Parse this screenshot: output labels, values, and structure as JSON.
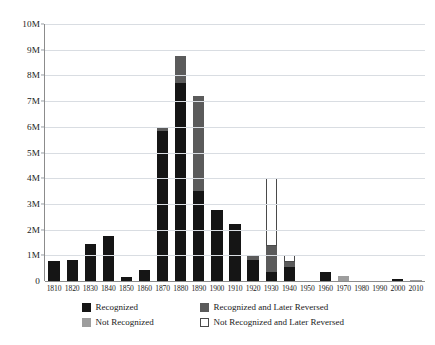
{
  "chart_data": {
    "type": "bar",
    "title": "",
    "subtitle": "",
    "xlabel": "",
    "ylabel": "",
    "stacked": true,
    "grid": true,
    "legend_position": "bottom",
    "ylim": [
      0,
      10000000
    ],
    "ytick_values": [
      0,
      1000000,
      2000000,
      3000000,
      4000000,
      5000000,
      6000000,
      7000000,
      8000000,
      9000000,
      10000000
    ],
    "ytick_labels": [
      "0",
      "1M",
      "2M",
      "3M",
      "4M",
      "5M",
      "6M",
      "7M",
      "8M",
      "9M",
      "10M"
    ],
    "categories": [
      "1810",
      "1820",
      "1830",
      "1840",
      "1850",
      "1860",
      "1870",
      "1880",
      "1890",
      "1900",
      "1910",
      "1920",
      "1930",
      "1940",
      "1950",
      "1960",
      "1970",
      "1980",
      "1990",
      "2000",
      "2010"
    ],
    "series": [
      {
        "name": "Recognized",
        "color": "#151515",
        "values": [
          760000,
          820000,
          1450000,
          1750000,
          150000,
          440000,
          5850000,
          7700000,
          3500000,
          2750000,
          2200000,
          820000,
          340000,
          560000,
          0,
          350000,
          0,
          0,
          0,
          60000,
          0
        ]
      },
      {
        "name": "Recognized and Later Reversed",
        "color": "#5b5b5b",
        "values": [
          0,
          0,
          0,
          0,
          0,
          0,
          90000,
          1050000,
          3700000,
          0,
          0,
          200000,
          1010000,
          190000,
          0,
          0,
          0,
          0,
          0,
          0,
          0
        ]
      },
      {
        "name": "Not Recognized",
        "color": "#9d9d9d",
        "values": [
          0,
          0,
          0,
          0,
          0,
          0,
          0,
          0,
          0,
          0,
          0,
          0,
          0,
          0,
          0,
          0,
          200000,
          0,
          0,
          0,
          25000
        ]
      },
      {
        "name": "Not Recognized and Later Reversed",
        "color": "#ffffff",
        "values": [
          0,
          0,
          0,
          0,
          0,
          0,
          0,
          0,
          0,
          0,
          0,
          0,
          2650000,
          250000,
          0,
          0,
          0,
          0,
          0,
          0,
          0
        ]
      }
    ]
  },
  "legend": {
    "items": [
      {
        "label": "Recognized",
        "swatch": "#151515",
        "outlined": false
      },
      {
        "label": "Recognized and Later Reversed",
        "swatch": "#5b5b5b",
        "outlined": false
      },
      {
        "label": "Not Recognized",
        "swatch": "#9d9d9d",
        "outlined": false
      },
      {
        "label": "Not Recognized and Later Reversed",
        "swatch": "#ffffff",
        "outlined": true
      }
    ]
  }
}
